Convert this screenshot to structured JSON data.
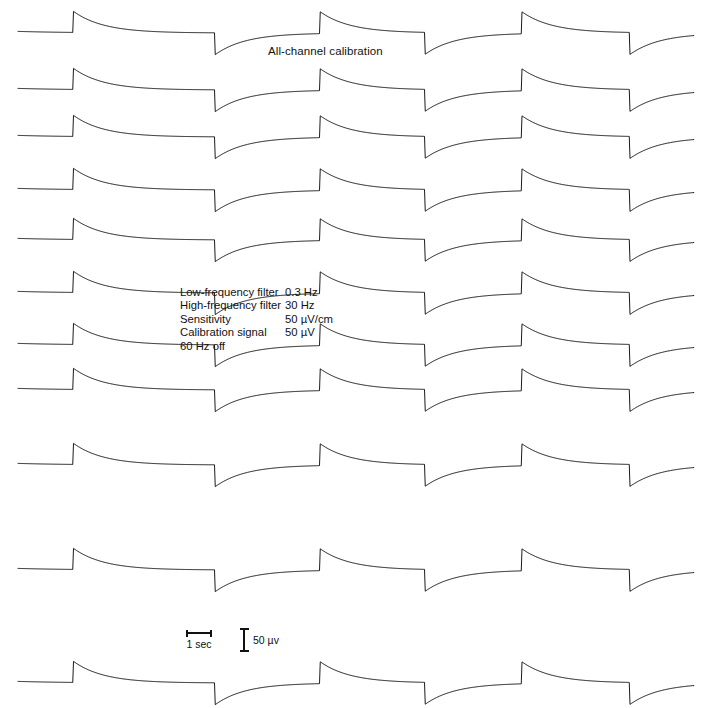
{
  "chart_data": {
    "type": "line",
    "title": "All-channel calibration",
    "xlabel": "",
    "ylabel": "",
    "grid": false,
    "legend_position": "none",
    "n_channels": 11,
    "pulse_up_x": [
      73,
      320,
      522
    ],
    "pulse_down_x": [
      215,
      425,
      630
    ],
    "trace_x_start": 18,
    "trace_x_end": 694,
    "channel_baselines_y": [
      33,
      90,
      137,
      190,
      240,
      293,
      345,
      390,
      465,
      570,
      683
    ],
    "pulse_amplitude_px": 22,
    "decay_constant_px": 30,
    "units": {
      "time": "sec",
      "amplitude": "µV"
    }
  },
  "title": {
    "text": "All-channel calibration"
  },
  "parameters": {
    "rows": [
      {
        "label": "Low-frequency filter",
        "value": "0.3 Hz"
      },
      {
        "label": "High-frequency filter",
        "value": "30 Hz"
      },
      {
        "label": "Sensitivity",
        "value": "50 µV/cm"
      },
      {
        "label": "Calibration signal",
        "value": "50 µV"
      }
    ],
    "note": "60 Hz off"
  },
  "scalebars": {
    "time": {
      "label": "1 sec",
      "length_px": 26
    },
    "amplitude": {
      "label": "50 µv",
      "height_px": 24
    }
  },
  "colors": {
    "trace": "#1a1a1a",
    "background": "#ffffff",
    "text": "#111111"
  }
}
